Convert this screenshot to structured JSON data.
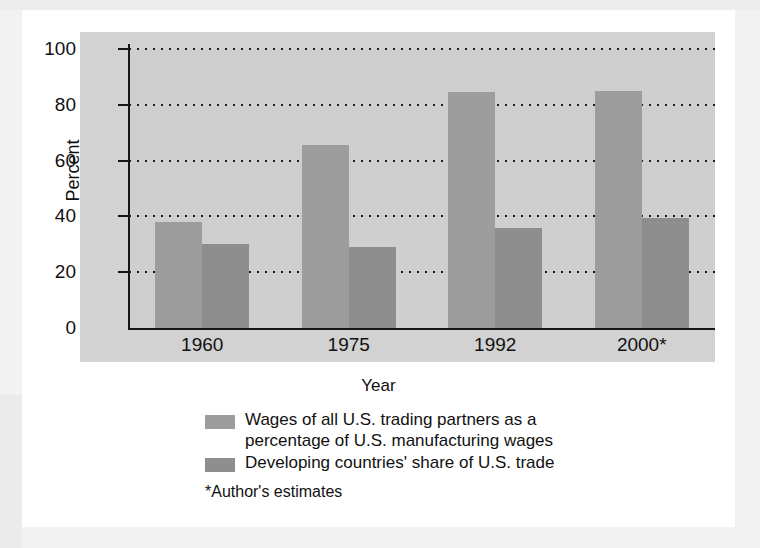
{
  "chart_data": {
    "type": "bar",
    "title": "",
    "xlabel": "Year",
    "ylabel": "Percent",
    "categories": [
      "1960",
      "1975",
      "1992",
      "2000*"
    ],
    "series": [
      {
        "name": "Wages of all U.S. trading partners as a percentage of U.S. manufacturing wages",
        "color": "#9d9d9d",
        "values": [
          38,
          65.5,
          84.5,
          85
        ]
      },
      {
        "name": "Developing countries' share of U.S. trade",
        "color": "#8e8e8e",
        "values": [
          30,
          29,
          36,
          39.5
        ]
      }
    ],
    "ylim": [
      0,
      100
    ],
    "yticks": [
      "0",
      "20",
      "40",
      "60",
      "80",
      "100"
    ],
    "ytick_values": [
      0,
      20,
      40,
      60,
      80,
      100
    ],
    "grid": "horizontal-dotted",
    "legend_position": "below",
    "footnote": "*Author's estimates"
  },
  "axes": {
    "y_title": "Percent",
    "x_title": "Year"
  },
  "legend": {
    "items": [
      {
        "line1": "Wages of all U.S. trading partners as a",
        "line2": "percentage of U.S. manufacturing wages",
        "swatch": "series-0-swatch"
      },
      {
        "line1": "Developing countries' share of U.S. trade",
        "line2": "",
        "swatch": "series-1-swatch"
      }
    ]
  },
  "footnote": "*Author's estimates",
  "ticks": {
    "y": [
      "100",
      "80",
      "60",
      "40",
      "20",
      "0"
    ]
  },
  "categories": [
    "1960",
    "1975",
    "1992",
    "2000*"
  ],
  "colors": {
    "series_a": "#9d9d9d",
    "series_b": "#8e8e8e",
    "panel_bg": "#d2d2d2",
    "plot_bg": "#cfcfcf",
    "axis": "#161616",
    "text": "#111111",
    "card_bg": "#ffffff",
    "page_bg": "#f2f2f2"
  }
}
